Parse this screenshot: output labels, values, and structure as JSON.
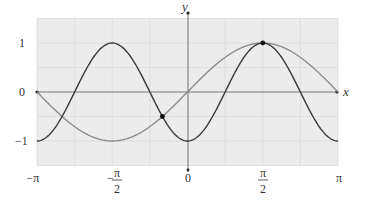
{
  "chart_data": {
    "type": "line",
    "title": "",
    "xlabel": "x",
    "ylabel": "y",
    "xlim": [
      -3.14159,
      3.14159
    ],
    "ylim": [
      -1.5,
      1.5
    ],
    "grid": true,
    "x_ticks": [
      {
        "value": -3.14159,
        "label": "−π"
      },
      {
        "value": -1.5708,
        "label_num": "π",
        "label_den": "2",
        "sign": "−"
      },
      {
        "value": 0,
        "label": "0"
      },
      {
        "value": 1.5708,
        "label_num": "π",
        "label_den": "2",
        "sign": ""
      },
      {
        "value": 3.14159,
        "label": "π"
      }
    ],
    "y_ticks": [
      {
        "value": 1,
        "label": "1"
      },
      {
        "value": 0,
        "label": "0"
      },
      {
        "value": -1,
        "label": "−1"
      }
    ],
    "series": [
      {
        "name": "y = −cos(2x)",
        "color": "#3a3a3a",
        "function": "-cos(2x)"
      },
      {
        "name": "y = sin(x)",
        "color": "#8c8c8c",
        "function": "sin(x)"
      }
    ],
    "intersection_points": [
      {
        "x": -0.5236,
        "y": -0.5
      },
      {
        "x": 1.5708,
        "y": 1
      }
    ]
  },
  "labels": {
    "x_axis": "x",
    "y_axis": "y",
    "y1": "1",
    "y0": "0",
    "ym1": "−1",
    "xmpi": "−π",
    "xmhalf_sign": "−",
    "pi": "π",
    "two": "2",
    "x0": "0",
    "xpi": "π"
  }
}
